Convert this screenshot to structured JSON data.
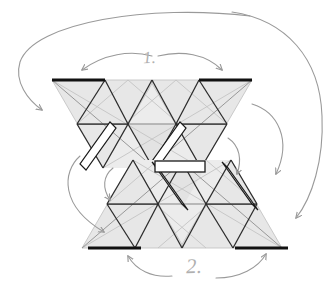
{
  "figure": {
    "type": "diagram",
    "background_color": "#ffffff",
    "canvas": {
      "width": 336,
      "height": 284
    }
  },
  "labels": {
    "step_1": "1.",
    "step_2": "2."
  },
  "colors": {
    "panel_fill": "#e7e7e7",
    "panel_fill_light": "#efefef",
    "panel_fill_dark": "#dcdcdc",
    "crease_dark": "#2b2b2b",
    "crease_light": "#b5b5b5",
    "crease_mid": "#8a8a8a",
    "edge_highlight": "#111111",
    "flap_fill": "#ffffff",
    "flap_stroke": "#1a1a1a",
    "arrow_stroke": "#9a9a9a",
    "label_color": "#b0b0b0"
  },
  "upper_group": {
    "name": "upper-triangle-cluster",
    "thick_edges": [
      {
        "name": "top-left-thick-edge",
        "x1": 52,
        "y1": 80,
        "x2": 105,
        "y2": 80
      },
      {
        "name": "top-right-thick-edge",
        "x1": 199,
        "y1": 80,
        "x2": 252,
        "y2": 80
      }
    ],
    "flaps": [
      {
        "name": "upper-left-flap",
        "x1": 108,
        "y1": 124,
        "x2": 80,
        "y2": 168
      },
      {
        "name": "upper-right-flap",
        "x1": 178,
        "y1": 124,
        "x2": 150,
        "y2": 168
      }
    ]
  },
  "lower_group": {
    "name": "lower-triangle-cluster",
    "thick_edges": [
      {
        "name": "bottom-left-thick-edge",
        "x1": 88,
        "y1": 248,
        "x2": 141,
        "y2": 248
      },
      {
        "name": "bottom-right-thick-edge",
        "x1": 235,
        "y1": 248,
        "x2": 288,
        "y2": 248
      }
    ],
    "flaps": [
      {
        "name": "lower-left-flap",
        "x1": 156,
        "y1": 164,
        "x2": 184,
        "y2": 208
      },
      {
        "name": "lower-right-flap",
        "x1": 226,
        "y1": 164,
        "x2": 254,
        "y2": 208
      }
    ]
  },
  "center_bar": {
    "name": "center-horizontal-flap",
    "x": 155,
    "y": 161,
    "width": 50,
    "height": 11
  },
  "arrows": [
    {
      "name": "arrow-outer-left-wrap",
      "direction": "down-left",
      "role": "step-1-outer-left"
    },
    {
      "name": "arrow-outer-right-wrap",
      "direction": "down-right",
      "role": "step-2-outer-right"
    },
    {
      "name": "arrow-top-fold-left",
      "direction": "down-left",
      "role": "step-1-left"
    },
    {
      "name": "arrow-top-fold-right",
      "direction": "down-right",
      "role": "step-1-right"
    },
    {
      "name": "arrow-mid-left-small",
      "direction": "up-down",
      "role": "mid-left-hinge"
    },
    {
      "name": "arrow-mid-right-small",
      "direction": "up-down",
      "role": "mid-right-hinge"
    },
    {
      "name": "arrow-left-swoop",
      "direction": "down",
      "role": "left-rotate"
    },
    {
      "name": "arrow-right-swoop",
      "direction": "down",
      "role": "right-rotate"
    },
    {
      "name": "arrow-bottom-left",
      "direction": "up-right",
      "role": "step-2-left"
    },
    {
      "name": "arrow-bottom-right",
      "direction": "up-right",
      "role": "step-2-right"
    }
  ]
}
